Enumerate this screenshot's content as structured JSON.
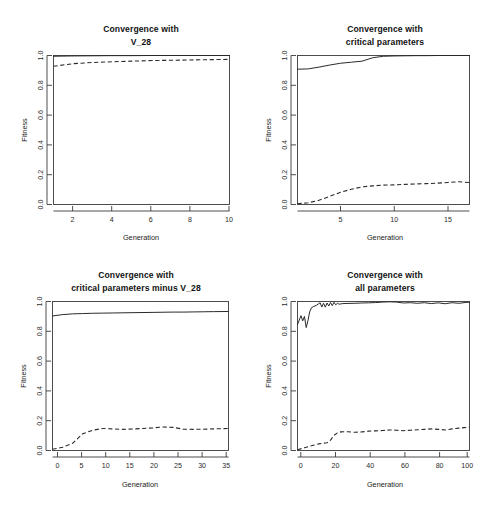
{
  "figure": {
    "background_color": "#ffffff",
    "line_color": "#2a2a2a",
    "panel_count": 4
  },
  "chart_data": [
    {
      "type": "line",
      "title": "Convergence with V_28",
      "title_lines": [
        "Convergence with",
        "V_28"
      ],
      "xlabel": "Generation",
      "ylabel": "Fitness",
      "xlim": [
        1,
        10
      ],
      "ylim": [
        0.0,
        1.0
      ],
      "xticks": [
        2,
        4,
        6,
        8,
        10
      ],
      "yticks": [
        0.0,
        0.2,
        0.4,
        0.6,
        0.8,
        1.0
      ],
      "ytick_labels": [
        "0.0",
        "0.2",
        "0.4",
        "0.6",
        "0.8",
        "1.0"
      ],
      "xtick_labels": [
        "2",
        "4",
        "6",
        "8",
        "10"
      ],
      "grid": false,
      "legend": "none",
      "series": [
        {
          "name": "Best fitness",
          "style": "solid",
          "x": [
            1,
            2,
            3,
            4,
            5,
            6,
            7,
            8,
            9,
            10
          ],
          "values": [
            0.995,
            0.997,
            0.998,
            0.999,
            0.999,
            1.0,
            1.0,
            1.0,
            1.0,
            1.0
          ]
        },
        {
          "name": "Mean fitness",
          "style": "dashed",
          "x": [
            1,
            2,
            3,
            4,
            5,
            6,
            7,
            8,
            9,
            10
          ],
          "values": [
            0.928,
            0.945,
            0.953,
            0.958,
            0.962,
            0.966,
            0.968,
            0.97,
            0.972,
            0.974
          ]
        }
      ]
    },
    {
      "type": "line",
      "title": "Convergence with critical parameters",
      "title_lines": [
        "Convergence with",
        "critical parameters"
      ],
      "xlabel": "Generation",
      "ylabel": "Fitness",
      "xlim": [
        1,
        17
      ],
      "ylim": [
        0.0,
        1.0
      ],
      "xticks": [
        5,
        10,
        15
      ],
      "yticks": [
        0.0,
        0.2,
        0.4,
        0.6,
        0.8,
        1.0
      ],
      "ytick_labels": [
        "0.0",
        "0.2",
        "0.4",
        "0.6",
        "0.8",
        "1.0"
      ],
      "xtick_labels": [
        "5",
        "10",
        "15"
      ],
      "grid": false,
      "legend": "none",
      "series": [
        {
          "name": "Best fitness",
          "style": "solid",
          "x": [
            1,
            2,
            3,
            4,
            5,
            6,
            7,
            8,
            9,
            10,
            11,
            12,
            13,
            14,
            15,
            16,
            17
          ],
          "values": [
            0.908,
            0.91,
            0.922,
            0.936,
            0.948,
            0.955,
            0.962,
            0.985,
            0.995,
            0.997,
            0.998,
            0.999,
            0.999,
            1.0,
            1.0,
            1.0,
            1.0
          ]
        },
        {
          "name": "Mean fitness",
          "style": "dashed",
          "x": [
            1,
            2,
            3,
            4,
            5,
            6,
            7,
            8,
            9,
            10,
            11,
            12,
            13,
            14,
            15,
            16,
            17
          ],
          "values": [
            0.005,
            0.012,
            0.028,
            0.055,
            0.082,
            0.102,
            0.118,
            0.125,
            0.13,
            0.132,
            0.135,
            0.138,
            0.14,
            0.143,
            0.148,
            0.153,
            0.147
          ]
        }
      ]
    },
    {
      "type": "line",
      "title": "Convergence with critical parameters minus V_28",
      "title_lines": [
        "Convergence with",
        "critical parameters minus V_28"
      ],
      "xlabel": "Generation",
      "ylabel": "Fitness",
      "xlim": [
        1,
        36
      ],
      "ylim": [
        0.0,
        1.0
      ],
      "xticks": [
        0,
        5,
        10,
        15,
        20,
        25,
        30,
        35
      ],
      "yticks": [
        0.0,
        0.2,
        0.4,
        0.6,
        0.8,
        1.0
      ],
      "ytick_labels": [
        "0.0",
        "0.2",
        "0.4",
        "0.6",
        "0.8",
        "1.0"
      ],
      "xtick_labels": [
        "0",
        "5",
        "10",
        "15",
        "20",
        "25",
        "30",
        "35"
      ],
      "grid": false,
      "legend": "none",
      "series": [
        {
          "name": "Best fitness",
          "style": "solid",
          "x": [
            1,
            3,
            5,
            7,
            9,
            11,
            13,
            15,
            17,
            19,
            21,
            23,
            25,
            27,
            29,
            31,
            33,
            36
          ],
          "values": [
            0.903,
            0.912,
            0.917,
            0.919,
            0.921,
            0.922,
            0.923,
            0.924,
            0.925,
            0.926,
            0.927,
            0.928,
            0.929,
            0.929,
            0.93,
            0.931,
            0.932,
            0.933
          ]
        },
        {
          "name": "Mean fitness",
          "style": "dashed",
          "x": [
            1,
            3,
            5,
            7,
            9,
            11,
            13,
            15,
            17,
            19,
            21,
            23,
            25,
            27,
            29,
            31,
            33,
            36
          ],
          "values": [
            0.008,
            0.022,
            0.048,
            0.112,
            0.136,
            0.148,
            0.145,
            0.142,
            0.144,
            0.148,
            0.152,
            0.158,
            0.155,
            0.143,
            0.142,
            0.143,
            0.145,
            0.148
          ]
        }
      ]
    },
    {
      "type": "line",
      "title": "Convergence with all parameters",
      "title_lines": [
        "Convergence with",
        "all parameters"
      ],
      "xlabel": "Generation",
      "ylabel": "Fitness",
      "xlim": [
        1,
        100
      ],
      "ylim": [
        0.0,
        1.0
      ],
      "xticks": [
        0,
        20,
        40,
        60,
        80,
        100
      ],
      "yticks": [
        0.0,
        0.2,
        0.4,
        0.6,
        0.8,
        1.0
      ],
      "ytick_labels": [
        "0.0",
        "0.2",
        "0.4",
        "0.6",
        "0.8",
        "1.0"
      ],
      "xtick_labels": [
        "0",
        "20",
        "40",
        "60",
        "80",
        "100"
      ],
      "grid": false,
      "legend": "none",
      "series": [
        {
          "name": "Best fitness",
          "style": "solid",
          "x": [
            1,
            3,
            4,
            5,
            6,
            7,
            8,
            9,
            10,
            12,
            14,
            15,
            16,
            17,
            18,
            19,
            20,
            21,
            22,
            23,
            24,
            25,
            27,
            30,
            34,
            38,
            42,
            46,
            50,
            54,
            58,
            62,
            66,
            70,
            74,
            78,
            82,
            86,
            90,
            94,
            98,
            100
          ],
          "values": [
            0.845,
            0.905,
            0.87,
            0.9,
            0.825,
            0.87,
            0.93,
            0.958,
            0.965,
            0.975,
            0.992,
            0.963,
            0.988,
            0.962,
            0.99,
            0.97,
            0.993,
            0.972,
            0.995,
            0.978,
            0.988,
            0.982,
            0.986,
            0.987,
            0.988,
            0.99,
            0.991,
            0.993,
            0.996,
            0.998,
            0.996,
            0.99,
            0.992,
            0.988,
            0.992,
            0.986,
            0.991,
            0.985,
            0.992,
            0.988,
            0.994,
            0.995
          ]
        },
        {
          "name": "Mean fitness",
          "style": "dashed",
          "x": [
            1,
            5,
            10,
            14,
            18,
            20,
            22,
            24,
            26,
            30,
            34,
            38,
            42,
            46,
            50,
            54,
            58,
            62,
            66,
            70,
            74,
            78,
            82,
            86,
            90,
            94,
            98,
            100
          ],
          "values": [
            0.005,
            0.018,
            0.035,
            0.046,
            0.052,
            0.07,
            0.102,
            0.118,
            0.125,
            0.126,
            0.122,
            0.125,
            0.13,
            0.132,
            0.134,
            0.138,
            0.136,
            0.133,
            0.136,
            0.139,
            0.142,
            0.145,
            0.142,
            0.138,
            0.145,
            0.15,
            0.155,
            0.158
          ]
        }
      ]
    }
  ]
}
